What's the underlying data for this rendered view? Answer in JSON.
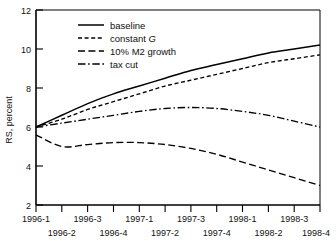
{
  "chart_data": {
    "type": "line",
    "title": "",
    "xlabel": "",
    "ylabel": "RS, percent",
    "ylim": [
      2,
      12
    ],
    "yticks": [
      2,
      4,
      6,
      8,
      10,
      12
    ],
    "grid": false,
    "legend_position": "top-left-inside",
    "categories": [
      "1996-1",
      "1996-2",
      "1996-3",
      "1996-4",
      "1997-1",
      "1997-2",
      "1997-3",
      "1997-4",
      "1998-1",
      "1998-2",
      "1998-3",
      "1998-4"
    ],
    "series": [
      {
        "name": "baseline",
        "style": "solid",
        "values": [
          6.0,
          6.6,
          7.2,
          7.7,
          8.1,
          8.5,
          8.9,
          9.2,
          9.5,
          9.8,
          10.0,
          10.2
        ]
      },
      {
        "name": "constant G",
        "style": "short-dash",
        "values": [
          6.0,
          6.4,
          6.9,
          7.3,
          7.7,
          8.1,
          8.4,
          8.7,
          9.0,
          9.3,
          9.5,
          9.7
        ]
      },
      {
        "name": "10% M2 growth",
        "style": "long-dash",
        "values": [
          5.6,
          5.0,
          5.1,
          5.2,
          5.2,
          5.1,
          4.9,
          4.6,
          4.2,
          3.8,
          3.4,
          3.0
        ]
      },
      {
        "name": "tax cut",
        "style": "dash-dot",
        "values": [
          6.0,
          6.2,
          6.4,
          6.6,
          6.8,
          6.95,
          7.0,
          6.95,
          6.8,
          6.6,
          6.3,
          6.0
        ]
      }
    ]
  },
  "yaxis": {
    "label": "RS, percent",
    "tick_labels": [
      "12",
      "10",
      "8",
      "6",
      "4",
      "2"
    ]
  },
  "xaxis": {
    "top_row_labels": [
      "1996-1",
      "1996-3",
      "1997-1",
      "1997-3",
      "1998-1",
      "1998-3"
    ],
    "bottom_row_labels": [
      "1996-2",
      "1996-4",
      "1997-2",
      "1997-4",
      "1998-2",
      "1998-4"
    ]
  },
  "legend": {
    "items": [
      {
        "label": "baseline",
        "style": "solid"
      },
      {
        "label_prefix": "constant ",
        "label_italic": "G",
        "label": "constant G",
        "style": "short-dash"
      },
      {
        "label": "10% M2 growth",
        "style": "long-dash"
      },
      {
        "label": "tax cut",
        "style": "dash-dot"
      }
    ]
  }
}
